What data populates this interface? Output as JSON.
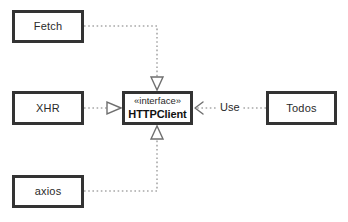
{
  "diagram": {
    "type": "uml-class-diagram",
    "background_color": "#ffffff",
    "border_color": "#333333",
    "line_color": "#9a9a9a",
    "text_color": "#2a2a2a"
  },
  "nodes": [
    {
      "id": "fetch",
      "name": "Fetch",
      "kind": "class",
      "x": 12,
      "y": 10,
      "width": 72,
      "height": 33
    },
    {
      "id": "xhr",
      "name": "XHR",
      "kind": "class",
      "x": 12,
      "y": 91,
      "width": 72,
      "height": 34
    },
    {
      "id": "axios",
      "name": "axios",
      "kind": "class",
      "x": 12,
      "y": 175,
      "width": 72,
      "height": 33
    },
    {
      "id": "httpclient",
      "stereotype": "«interface»",
      "name": "HTTPClient",
      "kind": "interface",
      "x": 122,
      "y": 91,
      "width": 71,
      "height": 34
    },
    {
      "id": "todos",
      "name": "Todos",
      "kind": "class",
      "x": 266,
      "y": 91,
      "width": 71,
      "height": 34
    }
  ],
  "edges": [
    {
      "id": "fetch-realizes-httpclient",
      "from": "fetch",
      "to": "httpclient",
      "kind": "realization",
      "line_style": "dotted",
      "arrowhead": "hollow-triangle",
      "label": ""
    },
    {
      "id": "xhr-realizes-httpclient",
      "from": "xhr",
      "to": "httpclient",
      "kind": "realization",
      "line_style": "dotted",
      "arrowhead": "hollow-triangle",
      "label": ""
    },
    {
      "id": "axios-realizes-httpclient",
      "from": "axios",
      "to": "httpclient",
      "kind": "realization",
      "line_style": "dotted",
      "arrowhead": "hollow-triangle",
      "label": ""
    },
    {
      "id": "todos-uses-httpclient",
      "from": "todos",
      "to": "httpclient",
      "kind": "dependency",
      "line_style": "dotted",
      "arrowhead": "open-arrow",
      "label": "Use"
    }
  ]
}
